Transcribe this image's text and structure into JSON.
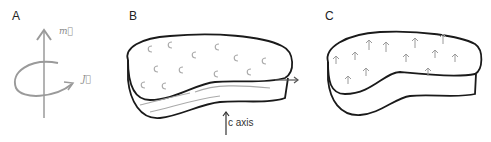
{
  "panels": [
    {
      "label": "A",
      "symbols": {
        "m": "m⃗",
        "j": "J⃗"
      }
    },
    {
      "label": "B",
      "symbols": {
        "n": "n̂"
      },
      "axis_label": "c axis"
    },
    {
      "label": "C"
    }
  ],
  "colors": {
    "outline": "#1a1a1a",
    "gray": "#9a9a9a",
    "background": "#ffffff"
  }
}
